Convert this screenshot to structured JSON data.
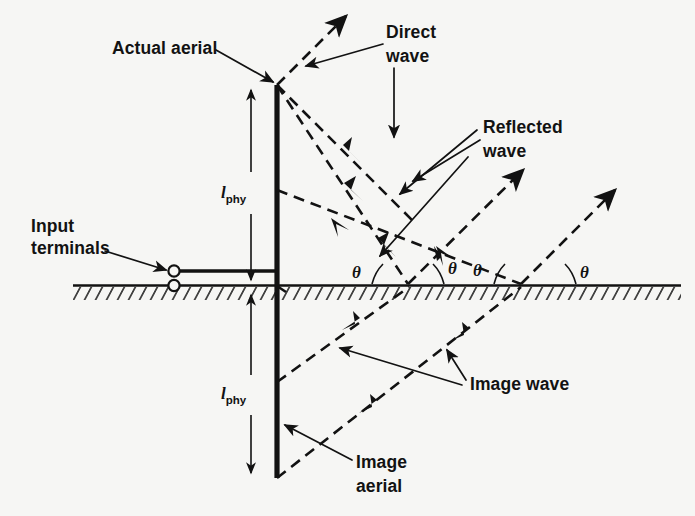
{
  "figure": {
    "background_color": "#f6f6f4",
    "ink_color": "#121212"
  },
  "labels": {
    "actual_aerial": "Actual aerial",
    "input_terminals_line1": "Input",
    "input_terminals_line2": "terminals",
    "direct_wave_line1": "Direct",
    "direct_wave_line2": "wave",
    "reflected_wave_line1": "Reflected",
    "reflected_wave_line2": "wave",
    "image_wave": "Image wave",
    "image_aerial_line1": "Image",
    "image_aerial_line2": "aerial",
    "length_symbol": "l",
    "length_subscript": "phy",
    "theta": "θ"
  },
  "angles": [
    {
      "id": "theta-1",
      "symbol": "θ",
      "x": 358,
      "y": 272
    },
    {
      "id": "theta-2",
      "symbol": "θ",
      "x": 455,
      "y": 268
    },
    {
      "id": "theta-3",
      "symbol": "θ",
      "x": 479,
      "y": 270
    },
    {
      "id": "theta-4",
      "symbol": "θ",
      "x": 562,
      "y": 272
    }
  ],
  "geometry": {
    "ground_y": 285,
    "ground_x_start": 73,
    "ground_x_end": 681,
    "aerial_x": 277,
    "aerial_top_y": 85,
    "aerial_bottom_y": 285,
    "image_aerial_top_y": 286,
    "image_aerial_bottom_y": 478,
    "terminal_upper": {
      "x": 173,
      "y": 271
    },
    "terminal_lower": {
      "x": 173,
      "y": 285
    },
    "reflection_point_1": {
      "x": 408,
      "y": 285
    },
    "reflection_point_2": {
      "x": 520,
      "y": 285
    }
  },
  "ray_paths": {
    "direct_upper": "M 277 85 L 345 17",
    "direct_lower": "M 277 85 L 412 220",
    "reflected_from_top": "M 277 85 L 408 285",
    "reflected_upward_1": "M 408 285 L 520 173",
    "reflected_mid": "M 277 190 L 520 285",
    "reflected_upward_2": "M 520 285 L 612 193",
    "image_ray_1": "M 277 286 L 408 285",
    "image_ray_upward_1": "M 277 380 L 408 285",
    "image_ray_upward_2": "M 277 478 L 520 285"
  }
}
